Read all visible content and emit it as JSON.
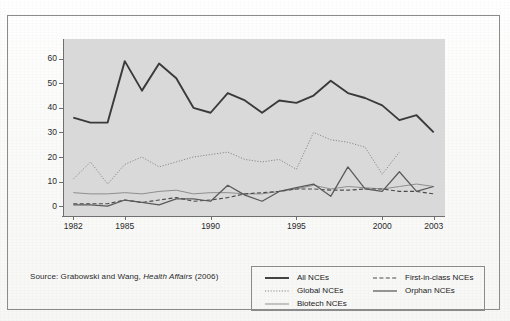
{
  "source_note": {
    "prefix": "Source: Grabowski and Wang, ",
    "journal": "Health Affairs",
    "suffix": " (2006)"
  },
  "legend": {
    "columns": [
      {
        "entries": [
          {
            "label": "All NCEs",
            "style": "solid-thick",
            "color": "#3a3a3a"
          },
          {
            "label": "Global NCEs",
            "style": "dotted",
            "color": "#8a8a8a"
          },
          {
            "label": "Biotech NCEs",
            "style": "solid-thin",
            "color": "#8a8a8a"
          }
        ]
      },
      {
        "entries": [
          {
            "label": "First-in-class NCEs",
            "style": "dashed",
            "color": "#4a4a4a"
          },
          {
            "label": "Orphan NCEs",
            "style": "solid-medium",
            "color": "#5a5a5a"
          }
        ]
      }
    ]
  },
  "chart_data": {
    "type": "line",
    "title": "",
    "subtitle": "",
    "xlabel": "",
    "ylabel": "",
    "xlim": [
      1981.4,
      2003.6
    ],
    "ylim": [
      -4,
      68
    ],
    "grid": false,
    "legend_position": "bottom-right",
    "plot_background": "#d9d9d9",
    "x": [
      1982,
      1983,
      1984,
      1985,
      1986,
      1987,
      1988,
      1989,
      1990,
      1991,
      1992,
      1993,
      1994,
      1995,
      1996,
      1997,
      1998,
      1999,
      2000,
      2001,
      2002,
      2003
    ],
    "xticks": [
      1982,
      1985,
      1990,
      1995,
      2000,
      2003
    ],
    "xtick_labels": [
      "1982",
      "1985",
      "1990",
      "1995",
      "2000",
      "2003"
    ],
    "yticks": [
      0,
      10,
      20,
      30,
      40,
      50,
      60
    ],
    "ytick_labels": [
      "0",
      "10",
      "20",
      "30",
      "40",
      "50",
      "60"
    ],
    "series": [
      {
        "name": "All NCEs",
        "style": "solid-thick",
        "color": "#3a3a3a",
        "values": [
          36,
          34,
          34,
          59,
          47,
          58,
          52,
          40,
          38,
          46,
          43,
          38,
          43,
          42,
          45,
          51,
          46,
          44,
          41,
          35,
          37,
          30
        ]
      },
      {
        "name": "Global NCEs",
        "style": "dotted",
        "color": "#8a8a8a",
        "values": [
          11,
          18,
          9,
          17,
          20,
          16,
          18,
          20,
          21,
          22,
          19,
          18,
          19,
          15,
          30,
          27,
          26,
          24,
          13,
          22,
          null,
          null
        ]
      },
      {
        "name": "Biotech NCEs",
        "style": "solid-thin",
        "color": "#8a8a8a",
        "values": [
          5.5,
          5,
          5,
          5.5,
          5,
          6,
          6.5,
          5,
          5.5,
          5.5,
          5,
          5,
          6,
          7,
          8.5,
          7,
          8,
          7.5,
          7,
          8,
          9,
          8
        ]
      },
      {
        "name": "First-in-class NCEs",
        "style": "dashed",
        "color": "#4a4a4a",
        "values": [
          1,
          1,
          1,
          2.5,
          1.5,
          2.5,
          3.5,
          2,
          2.5,
          3.5,
          5,
          5.5,
          6,
          7,
          7,
          6.5,
          6.5,
          7,
          7,
          6,
          6,
          5
        ]
      },
      {
        "name": "Orphan NCEs",
        "style": "solid-medium",
        "color": "#5a5a5a",
        "values": [
          0.5,
          0.5,
          0,
          2.5,
          1.5,
          0.5,
          3,
          3,
          2,
          8.5,
          4.5,
          2,
          6,
          7.5,
          9,
          4,
          16,
          7,
          6,
          14,
          6,
          8
        ]
      }
    ]
  }
}
